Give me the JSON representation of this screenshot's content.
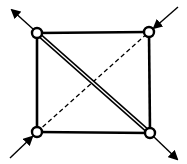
{
  "diagram": {
    "colors": {
      "stroke": "#000000",
      "background": "#ffffff",
      "node_fill": "#ffffff"
    },
    "nodes": [
      {
        "id": "top-left",
        "x": 37,
        "y": 33
      },
      {
        "id": "top-right",
        "x": 149,
        "y": 32
      },
      {
        "id": "bottom-left",
        "x": 37,
        "y": 132
      },
      {
        "id": "bottom-right",
        "x": 150,
        "y": 133
      }
    ],
    "edges": [
      {
        "id": "top",
        "from": "top-left",
        "to": "top-right",
        "style": "solid"
      },
      {
        "id": "right",
        "from": "top-right",
        "to": "bottom-right",
        "style": "solid"
      },
      {
        "id": "bottom",
        "from": "bottom-left",
        "to": "bottom-right",
        "style": "solid"
      },
      {
        "id": "left",
        "from": "top-left",
        "to": "bottom-left",
        "style": "solid"
      },
      {
        "id": "diagonal-double",
        "from": "top-left",
        "to": "bottom-right",
        "style": "double"
      },
      {
        "id": "diagonal-dashed",
        "from": "bottom-left",
        "to": "top-right",
        "style": "dashed"
      }
    ],
    "arrows": [
      {
        "id": "arrow-out-top-left",
        "node": "top-left",
        "direction": "outgoing",
        "end": {
          "x": 11,
          "y": 9
        }
      },
      {
        "id": "arrow-in-top-right",
        "node": "top-right",
        "direction": "incoming",
        "start": {
          "x": 178,
          "y": 7
        }
      },
      {
        "id": "arrow-in-bottom-left",
        "node": "bottom-left",
        "direction": "incoming",
        "start": {
          "x": 10,
          "y": 158
        }
      },
      {
        "id": "arrow-out-bottom-right",
        "node": "bottom-right",
        "direction": "outgoing",
        "end": {
          "x": 177,
          "y": 160
        }
      }
    ]
  }
}
